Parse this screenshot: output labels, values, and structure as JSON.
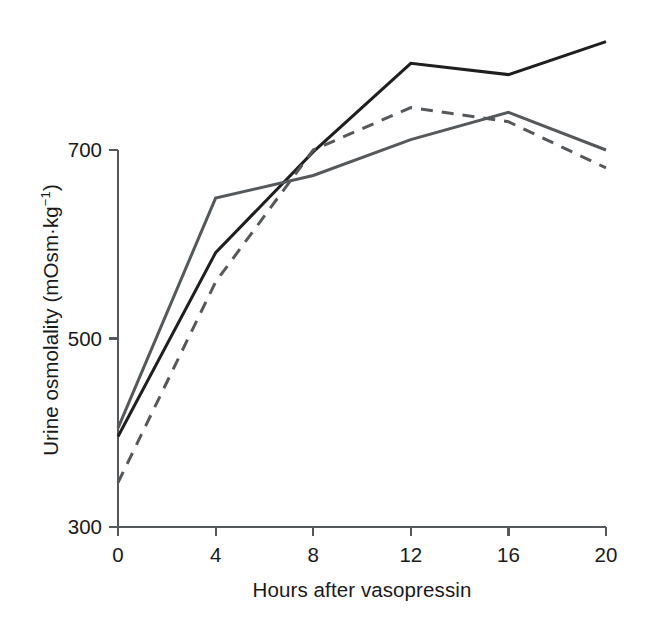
{
  "chart_data": {
    "type": "line",
    "title": "",
    "xlabel": "Hours after vasopressin",
    "ylabel_text": "Urine osmolality (mOsm",
    "ylabel_mid": "·kg",
    "ylabel_sup": "−1",
    "ylabel_close": ")",
    "ylabel_full": "Urine osmolality (mOsm·kg−1)",
    "x": [
      0,
      4,
      8,
      12,
      16,
      20
    ],
    "xtick_labels": [
      "0",
      "4",
      "8",
      "12",
      "16",
      "20"
    ],
    "ytick_labels": [
      "300",
      "500",
      "700"
    ],
    "yticks": [
      300,
      500,
      700
    ],
    "xlim": [
      0,
      20
    ],
    "ylim": [
      300,
      840
    ],
    "grid": false,
    "legend": "none",
    "series": [
      {
        "name": "solid-black",
        "color": "#1f1f1f",
        "style": "solid",
        "width": 3.0,
        "values": [
          396,
          591,
          698,
          792,
          780,
          815
        ]
      },
      {
        "name": "solid-gray",
        "color": "#55595c",
        "style": "solid",
        "width": 3.0,
        "values": [
          405,
          649,
          673,
          711,
          740,
          700
        ]
      },
      {
        "name": "dashed-gray",
        "color": "#55595c",
        "style": "dashed",
        "width": 3.0,
        "values": [
          347,
          560,
          700,
          745,
          730,
          681
        ]
      }
    ],
    "axis_color": "#55595c",
    "axis_width": 2.2,
    "background": "#ffffff"
  }
}
